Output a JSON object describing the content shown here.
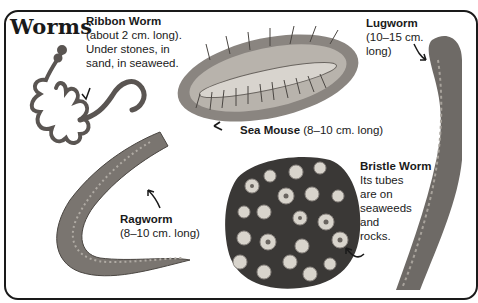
{
  "page": {
    "title": "Worms"
  },
  "species": [
    {
      "name": "Ribbon Worm",
      "details": [
        "(about 2 cm. long).",
        "Under stones, in",
        "sand, in seaweed."
      ]
    },
    {
      "name": "Sea Mouse",
      "details": [
        "(8–10 cm. long)"
      ]
    },
    {
      "name": "Lugworm",
      "details": [
        "(10–15 cm.",
        "long)"
      ]
    },
    {
      "name": "Bristle Worm",
      "details": [
        "Its tubes",
        "are on",
        "seaweeds",
        "and",
        "rocks."
      ]
    },
    {
      "name": "Ragworm",
      "details": [
        "(8–10 cm. long)"
      ]
    }
  ],
  "colors": {
    "ink": "#1a1a1a",
    "worm_gray": "#6e6a66",
    "rock_dark": "#3a3836",
    "shell": "#d8d4cc"
  }
}
